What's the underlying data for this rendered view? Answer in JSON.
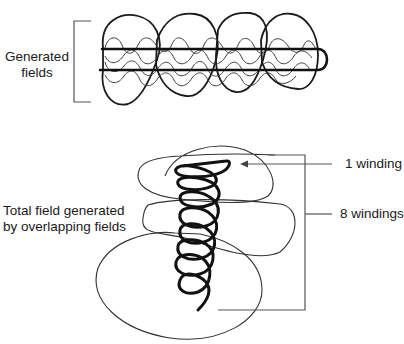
{
  "figure": {
    "top_cutoff_text": "",
    "upper_diagram": {
      "label_line1": "Generated",
      "label_line2": "fields"
    },
    "lower_diagram": {
      "left_label_line1": "Total field generated",
      "left_label_line2": "by overlapping fields",
      "callout_one": "1 winding",
      "callout_eight": "8 windings"
    },
    "colors": {
      "ink": "#1a1a1a",
      "thin_line": "#3a3a3a",
      "background": "#ffffff"
    }
  }
}
